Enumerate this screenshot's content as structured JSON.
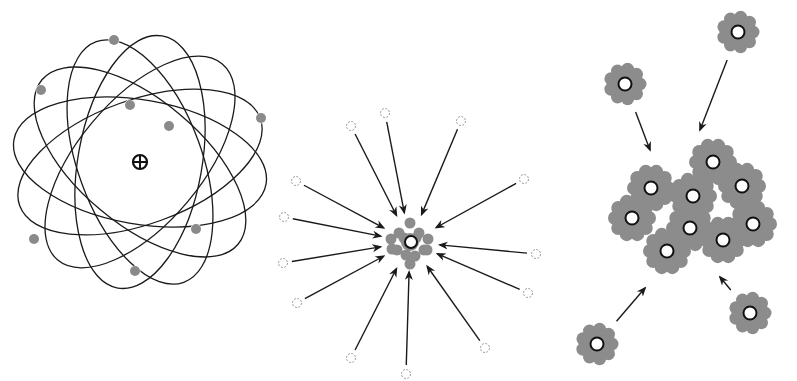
{
  "colors": {
    "background": "#ffffff",
    "line": "#1a1a1a",
    "electron": "#8a8a8a",
    "cloud": "#8c8c8c",
    "core_fill": "#ffffff",
    "ghost": "#9a9a9a"
  },
  "panels": [
    {
      "id": "atom",
      "description": "Atom with nucleus and elliptical electron orbits",
      "nucleus": {
        "x": 140,
        "y": 162,
        "symbol": "plus-in-circle"
      },
      "orbit_count": 6,
      "electrons": [
        {
          "x": 114,
          "y": 40
        },
        {
          "x": 41,
          "y": 90
        },
        {
          "x": 130,
          "y": 105
        },
        {
          "x": 169,
          "y": 126
        },
        {
          "x": 261,
          "y": 118
        },
        {
          "x": 196,
          "y": 229
        },
        {
          "x": 34,
          "y": 239
        },
        {
          "x": 135,
          "y": 271
        }
      ]
    },
    {
      "id": "collapse",
      "description": "Dashed particles with arrows converging on a central core",
      "center": {
        "x": 410,
        "y": 242
      },
      "sources": [
        {
          "x": 351,
          "y": 126
        },
        {
          "x": 385,
          "y": 113
        },
        {
          "x": 461,
          "y": 121
        },
        {
          "x": 296,
          "y": 181
        },
        {
          "x": 524,
          "y": 179
        },
        {
          "x": 284,
          "y": 217
        },
        {
          "x": 283,
          "y": 263
        },
        {
          "x": 536,
          "y": 254
        },
        {
          "x": 297,
          "y": 303
        },
        {
          "x": 528,
          "y": 293
        },
        {
          "x": 351,
          "y": 358
        },
        {
          "x": 485,
          "y": 348
        },
        {
          "x": 406,
          "y": 374
        }
      ]
    },
    {
      "id": "clustering",
      "description": "Small clusters moving toward a large merged cluster",
      "cluster_cores": [
        {
          "x": 651,
          "y": 188
        },
        {
          "x": 713,
          "y": 162
        },
        {
          "x": 742,
          "y": 186
        },
        {
          "x": 693,
          "y": 196
        },
        {
          "x": 632,
          "y": 218
        },
        {
          "x": 690,
          "y": 228
        },
        {
          "x": 753,
          "y": 224
        },
        {
          "x": 723,
          "y": 240
        },
        {
          "x": 667,
          "y": 251
        }
      ],
      "satellites": [
        {
          "x": 625,
          "y": 84,
          "arrow_to": {
            "x": 650,
            "y": 150
          }
        },
        {
          "x": 738,
          "y": 32,
          "arrow_to": {
            "x": 700,
            "y": 130
          }
        },
        {
          "x": 597,
          "y": 344,
          "arrow_to": {
            "x": 645,
            "y": 288
          }
        },
        {
          "x": 750,
          "y": 313,
          "arrow_to": {
            "x": 720,
            "y": 277
          }
        }
      ]
    }
  ]
}
